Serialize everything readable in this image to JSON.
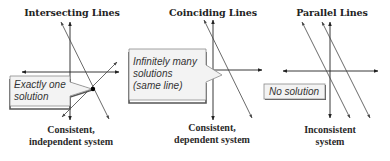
{
  "panels": [
    {
      "id": "intersecting",
      "title": "Intersecting Lines",
      "note_lines": [
        "Exactly one",
        "solution"
      ],
      "caption_lines": [
        "Consistent,",
        "independent system"
      ]
    },
    {
      "id": "coinciding",
      "title": "Coinciding Lines",
      "note_lines": [
        "Infinitely many",
        "solutions",
        "(same line)"
      ],
      "caption_lines": [
        "Consistent,",
        "dependent system"
      ]
    },
    {
      "id": "parallel",
      "title": "Parallel Lines",
      "note_lines": [
        "No solution"
      ],
      "caption_lines": [
        "Inconsistent",
        "system"
      ]
    }
  ],
  "colors": {
    "axis": "#222222",
    "line": "#444444",
    "box_fill": "#f3f3f3",
    "box_border": "#8a8a8a",
    "box_shadow": "#555555",
    "point": "#000000"
  }
}
